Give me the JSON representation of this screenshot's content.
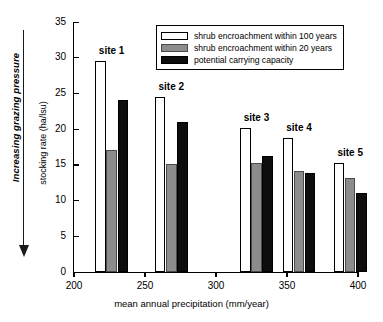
{
  "chart_data": {
    "type": "bar",
    "title": "",
    "xlabel": "mean annual precipitation (mm/year)",
    "ylabel": "stocking rate (ha/lsu)",
    "xlim": [
      200,
      400
    ],
    "ylim": [
      0,
      35
    ],
    "xticks": [
      200,
      250,
      300,
      350,
      400
    ],
    "yticks": [
      0,
      5,
      10,
      15,
      20,
      25,
      30,
      35
    ],
    "grid": false,
    "legend_position": "top-right",
    "categories": [
      "site 1",
      "site 2",
      "site 3",
      "site 4",
      "site 5"
    ],
    "x": [
      215,
      257,
      317,
      347,
      383
    ],
    "series": [
      {
        "name": "shrub encroachment within 100 years",
        "color": "#ffffff",
        "values": [
          29.6,
          24.5,
          20.1,
          18.7,
          15.2
        ]
      },
      {
        "name": "shrub encroachment within 20 years",
        "color": "#8c8c8c",
        "values": [
          17.1,
          15.1,
          15.2,
          14.2,
          13.2
        ]
      },
      {
        "name": "potential carrying capacity",
        "color": "#0d0d0d",
        "values": [
          24.1,
          21.0,
          16.2,
          13.9,
          11.1
        ]
      }
    ],
    "annotations": [
      {
        "text": "Increasing grazing pressure",
        "type": "axis-arrow-label",
        "orientation": "vertical-down"
      }
    ]
  },
  "axes": {
    "y_tick_labels": [
      "0",
      "5",
      "10",
      "15",
      "20",
      "25",
      "30",
      "35"
    ],
    "x_tick_labels": [
      "200",
      "250",
      "300",
      "350",
      "400"
    ],
    "y_axis_title": "stocking rate (ha/lsu)",
    "x_axis_title": "mean annual precipitation (mm/year)"
  },
  "legend": {
    "items": [
      {
        "label": "shrub encroachment within 100 years",
        "swatch": "white"
      },
      {
        "label": "shrub encroachment within 20 years",
        "swatch": "gray"
      },
      {
        "label": "potential carrying capacity",
        "swatch": "black"
      }
    ]
  },
  "annotation": {
    "grazing_pressure_label": "Increasing grazing pressure"
  },
  "site_labels": [
    "site 1",
    "site 2",
    "site 3",
    "site 4",
    "site 5"
  ]
}
